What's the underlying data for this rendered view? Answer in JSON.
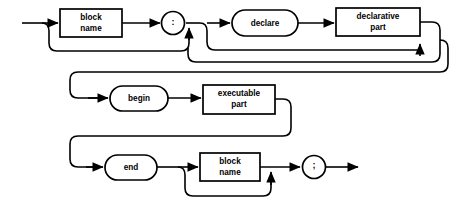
{
  "diagram": {
    "type": "railroad-syntax-diagram",
    "name": "block",
    "background_color": "#ffffff",
    "line_color": "#000000",
    "rows": [
      {
        "row_index": 0,
        "nodes": [
          {
            "id": "block-name-1",
            "shape": "rectangle",
            "label_line_1": "block",
            "label_line_2": "name",
            "x": 60,
            "y": 9,
            "width": 62,
            "height": 28,
            "optional": true
          },
          {
            "id": "colon-1",
            "shape": "circle",
            "label_line_1": ":",
            "label_line_2": "",
            "x": 162,
            "y": 10,
            "width": 24,
            "height": 24,
            "optional": false
          },
          {
            "id": "declare",
            "shape": "oval",
            "label_line_1": "declare",
            "label_line_2": "",
            "x": 232,
            "y": 9,
            "width": 66,
            "height": 26,
            "optional": true
          },
          {
            "id": "declarative-part",
            "shape": "rectangle",
            "label_line_1": "declarative",
            "label_line_2": "part",
            "x": 336,
            "y": 8,
            "width": 84,
            "height": 28,
            "optional": false
          }
        ]
      },
      {
        "row_index": 1,
        "nodes": [
          {
            "id": "begin",
            "shape": "oval",
            "label_line_1": "begin",
            "label_line_2": "",
            "x": 110,
            "y": 87,
            "width": 58,
            "height": 25,
            "optional": true
          },
          {
            "id": "executable-part",
            "shape": "rectangle",
            "label_line_1": "executable",
            "label_line_2": "part",
            "x": 203,
            "y": 85,
            "width": 72,
            "height": 29,
            "optional": false
          }
        ]
      },
      {
        "row_index": 2,
        "nodes": [
          {
            "id": "end",
            "shape": "oval",
            "label_line_1": "end",
            "label_line_2": "",
            "x": 105,
            "y": 155,
            "width": 52,
            "height": 25,
            "optional": false
          },
          {
            "id": "block-name-2",
            "shape": "rectangle",
            "label_line_1": "block",
            "label_line_2": "name",
            "x": 200,
            "y": 153,
            "width": 60,
            "height": 28,
            "optional": true
          },
          {
            "id": "semicolon-1",
            "shape": "circle",
            "label_line_1": ";",
            "label_line_2": "",
            "x": 303,
            "y": 155,
            "width": 23,
            "height": 23,
            "optional": false
          }
        ]
      }
    ],
    "entry_label": "entry-arrow",
    "exit_label": "exit-arrow"
  }
}
